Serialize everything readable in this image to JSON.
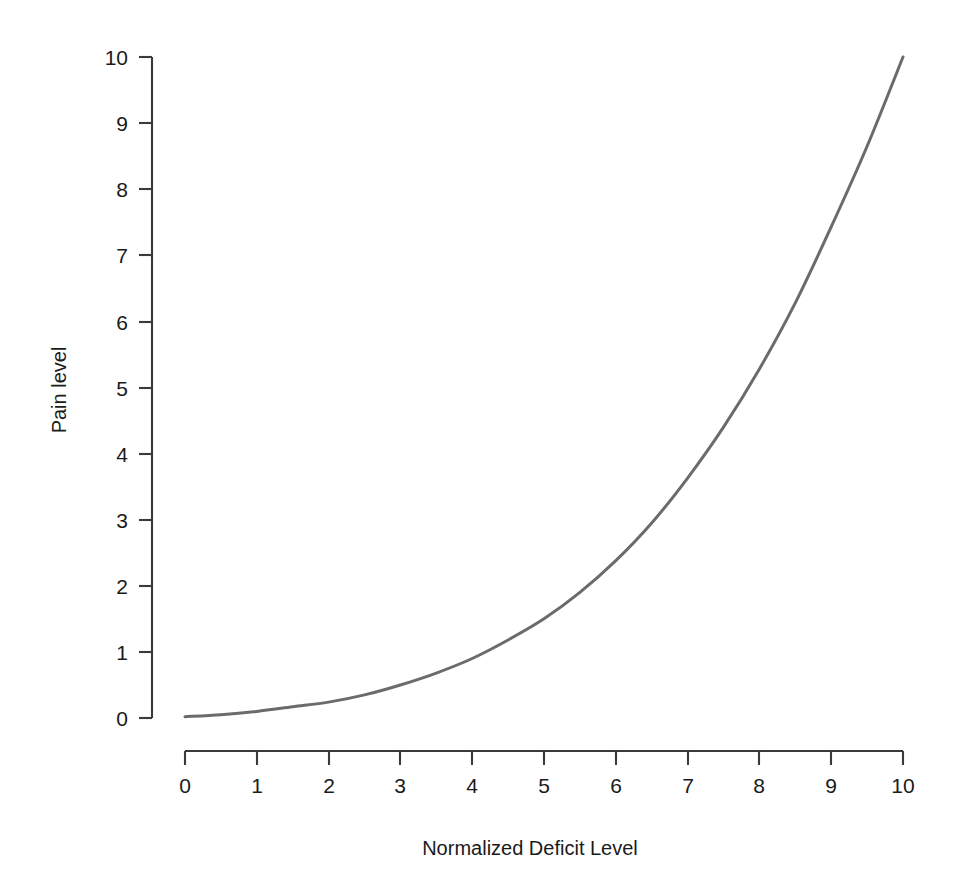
{
  "figure": {
    "background_color": "#ffffff",
    "axis_color": "#3a3a3a"
  },
  "chart_data": {
    "type": "line",
    "title": "",
    "subtitle": "",
    "xlabel": "Normalized Deficit Level",
    "ylabel": "Pain level",
    "xlim": [
      0,
      10
    ],
    "ylim": [
      0,
      10
    ],
    "xticks": [
      "0",
      "1",
      "2",
      "3",
      "4",
      "5",
      "6",
      "7",
      "8",
      "9",
      "10"
    ],
    "yticks": [
      "0",
      "1",
      "2",
      "3",
      "4",
      "5",
      "6",
      "7",
      "8",
      "9",
      "10"
    ],
    "grid": false,
    "legend": false,
    "legend_position": "none",
    "series": [
      {
        "name": "Pain level",
        "color": "#6b6b6b",
        "line_width": 3,
        "x": [
          0,
          0.5,
          1,
          1.5,
          2,
          2.5,
          3,
          3.5,
          4,
          4.5,
          5,
          5.5,
          6,
          6.5,
          7,
          7.5,
          8,
          8.5,
          9,
          9.5,
          10
        ],
        "values": [
          0.02,
          0.05,
          0.1,
          0.17,
          0.24,
          0.35,
          0.5,
          0.68,
          0.9,
          1.18,
          1.5,
          1.9,
          2.38,
          2.95,
          3.63,
          4.4,
          5.28,
          6.28,
          7.43,
          8.65,
          10.0
        ]
      }
    ],
    "annotations": []
  }
}
